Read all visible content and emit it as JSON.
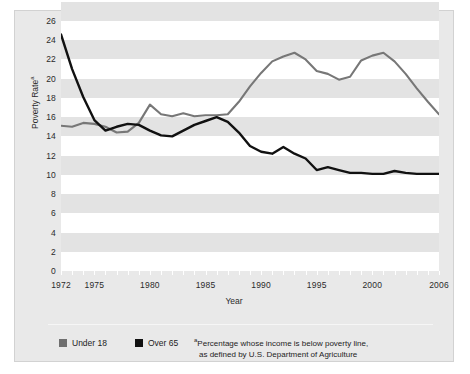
{
  "chart_data": {
    "type": "line",
    "title": "",
    "xlabel": "Year",
    "ylabel": "Poverty Rate",
    "ylabel_footnote_marker": "a",
    "xlim": [
      1972,
      2006
    ],
    "ylim": [
      0,
      26
    ],
    "yticks": [
      26,
      24,
      22,
      20,
      18,
      16,
      14,
      12,
      10,
      8,
      6,
      4,
      2,
      0
    ],
    "xticks": [
      1972,
      1975,
      1980,
      1985,
      1990,
      1995,
      2000,
      2006
    ],
    "grid": "horizontal banding",
    "legend_position": "below plot, left",
    "x": [
      1972,
      1973,
      1974,
      1975,
      1976,
      1977,
      1978,
      1979,
      1980,
      1981,
      1982,
      1983,
      1984,
      1985,
      1986,
      1987,
      1988,
      1989,
      1990,
      1991,
      1992,
      1993,
      1994,
      1995,
      1996,
      1997,
      1998,
      1999,
      2000,
      2001,
      2002,
      2003,
      2004,
      2005,
      2006
    ],
    "series": [
      {
        "name": "Under 18",
        "color": "#777777",
        "values": [
          15.1,
          15.0,
          15.4,
          15.3,
          15.0,
          14.4,
          14.5,
          15.4,
          17.3,
          16.3,
          16.1,
          16.4,
          16.1,
          16.2,
          16.2,
          16.3,
          17.6,
          19.2,
          20.6,
          21.8,
          22.3,
          22.7,
          22.0,
          20.8,
          20.5,
          19.9,
          20.2,
          21.9,
          22.4,
          22.7,
          21.8,
          20.5,
          19.0,
          17.6,
          16.3
        ]
      },
      {
        "name": "Over 65",
        "color": "#111111",
        "values": [
          24.6,
          21.0,
          18.1,
          15.7,
          14.6,
          15.0,
          15.3,
          15.2,
          14.6,
          14.1,
          14.0,
          14.6,
          15.2,
          15.6,
          16.0,
          15.5,
          14.4,
          13.0,
          12.4,
          12.2,
          12.9,
          12.2,
          11.7,
          10.5,
          10.8,
          10.5,
          10.2,
          10.2,
          10.1,
          10.1,
          10.4,
          10.2,
          10.1,
          10.1,
          10.1
        ]
      }
    ]
  },
  "axis": {
    "y_title": "Poverty Rate",
    "y_title_marker": "a",
    "x_title": "Year",
    "y_ticks": [
      "26",
      "24",
      "22",
      "20",
      "18",
      "16",
      "14",
      "12",
      "10",
      "8",
      "6",
      "4",
      "2",
      "0"
    ],
    "x_ticks": [
      "1972",
      "1975",
      "1980",
      "1985",
      "1990",
      "1995",
      "2000",
      "2006"
    ]
  },
  "legend": {
    "items": [
      {
        "label": "Under 18",
        "color": "#6f6f6f"
      },
      {
        "label": "Over 65",
        "color": "#111111"
      }
    ]
  },
  "footnote": {
    "marker": "a",
    "line1": "Percentage whose income is below poverty line,",
    "line2": "as defined by U.S. Department of Agriculture"
  }
}
